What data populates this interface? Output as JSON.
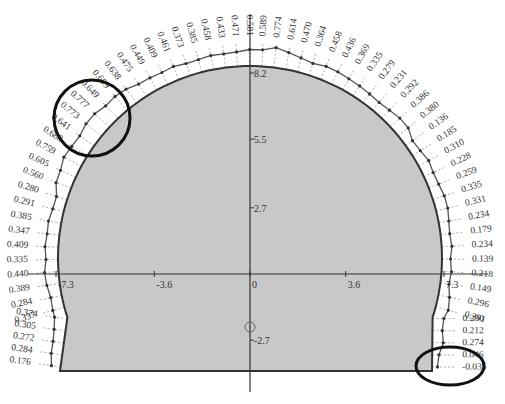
{
  "chart_data": {
    "type": "diagram",
    "title": "",
    "x_axis": {
      "ticks": [
        -7.3,
        -3.6,
        0,
        3.6,
        7.3
      ],
      "tick_labels": [
        "-7.3",
        "-3.6",
        "0",
        "3.6",
        "7.3"
      ]
    },
    "y_axis": {
      "ticks": [
        -2.7,
        2.7,
        5.5,
        8.2
      ],
      "tick_labels": [
        "-2.7",
        "2.7",
        "5.5",
        "8.2"
      ]
    },
    "section": {
      "fill": "#c8c8c8",
      "outline": "#333333",
      "crown_height": 8.2,
      "half_span": 7.3,
      "invert_y": -3.6
    },
    "values_left_bottom_to_top": [
      "0.176",
      "0.284",
      "0.272",
      "0.305",
      "0.374",
      "0.337",
      "0.284",
      "0.389",
      "0.440",
      "0.335",
      "0.409",
      "0.347",
      "0.385",
      "0.291",
      "0.280",
      "0.560",
      "0.605",
      "0.759",
      "0.688",
      "0.641",
      "0.773",
      "0.777",
      "0.649",
      "0.699",
      "0.638",
      "0.475",
      "0.449",
      "0.409",
      "0.461",
      "0.373",
      "0.385",
      "0.458",
      "0.433",
      "0.471"
    ],
    "values_right_top_to_bottom": [
      "0.581",
      "0.589",
      "0.774",
      "0.614",
      "0.470",
      "0.364",
      "0.458",
      "0.436",
      "0.369",
      "0.335",
      "0.279",
      "0.231",
      "0.292",
      "0.386",
      "0.380",
      "0.136",
      "0.185",
      "0.310",
      "0.228",
      "0.259",
      "0.335",
      "0.331",
      "0.234",
      "0.179",
      "0.234",
      "0.139",
      "0.218",
      "0.149",
      "0.296",
      "0.391",
      "0.290",
      "0.212",
      "0.274",
      "0.046",
      "-0.035"
    ],
    "highlights": [
      {
        "region": "upper-left shoulder",
        "shape": "circle",
        "values": [
          "0.688",
          "0.641",
          "0.773",
          "0.777",
          "0.649",
          "0.699"
        ]
      },
      {
        "region": "lower-right foot",
        "shape": "ellipse",
        "values": [
          "0.274",
          "0.046",
          "-0.035"
        ]
      }
    ],
    "center_marker": {
      "x": 0,
      "y": -1.9,
      "shape": "small circle"
    }
  }
}
